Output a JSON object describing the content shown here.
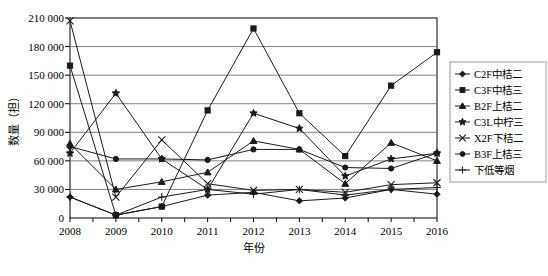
{
  "chart_data": {
    "type": "line",
    "title": "",
    "xlabel": "年份",
    "ylabel": "数量（担）",
    "grid": true,
    "legend_position": "right",
    "categories": [
      "2008",
      "2009",
      "2010",
      "2011",
      "2012",
      "2013",
      "2014",
      "2015",
      "2016"
    ],
    "xlim": [
      "2008",
      "2016"
    ],
    "ylim": [
      0,
      210000
    ],
    "ytick_labels": [
      "0",
      "30 000",
      "60 000",
      "90 000",
      "120 000",
      "150 000",
      "180 000",
      "210 000"
    ],
    "ytick_values": [
      0,
      30000,
      60000,
      90000,
      120000,
      150000,
      180000,
      210000
    ],
    "series": [
      {
        "name": "C2F中桔二",
        "marker": "diamond",
        "values": [
          22000,
          3000,
          12000,
          24000,
          27000,
          18000,
          21000,
          30000,
          25000
        ]
      },
      {
        "name": "C3F中桔三",
        "marker": "square",
        "values": [
          160000,
          3000,
          12000,
          113000,
          199000,
          110000,
          65000,
          139000,
          174000
        ]
      },
      {
        "name": "B2F上桔二",
        "marker": "triangle",
        "values": [
          78000,
          30000,
          38000,
          48000,
          81000,
          72000,
          36000,
          79000,
          60000
        ]
      },
      {
        "name": "C3L中柠三",
        "marker": "star",
        "values": [
          68000,
          131000,
          62000,
          30000,
          110000,
          94000,
          44000,
          62000,
          68000
        ]
      },
      {
        "name": "X2F下桔二",
        "marker": "cross-x",
        "values": [
          207000,
          22000,
          82000,
          36000,
          29000,
          30000,
          27000,
          35000,
          37000
        ]
      },
      {
        "name": "B3F上桔三",
        "marker": "circle",
        "values": [
          75000,
          62000,
          62000,
          61000,
          72000,
          72000,
          53000,
          52000,
          68000
        ]
      },
      {
        "name": "下低等烟",
        "marker": "plus",
        "values": [
          22000,
          3000,
          22000,
          30000,
          25000,
          30000,
          24000,
          30000,
          32000
        ]
      }
    ]
  },
  "legend": {
    "items": [
      {
        "label": "C2F中桔二",
        "marker": "diamond"
      },
      {
        "label": "C3F中桔三",
        "marker": "square"
      },
      {
        "label": "B2F上桔二",
        "marker": "triangle"
      },
      {
        "label": "C3L中柠三",
        "marker": "star"
      },
      {
        "label": "X2F下桔二",
        "marker": "cross-x"
      },
      {
        "label": "B3F上桔三",
        "marker": "circle"
      },
      {
        "label": "下低等烟",
        "marker": "plus"
      }
    ]
  },
  "colors": {
    "series_stroke": "#1a1a1a",
    "gridline": "#808080",
    "plot_border": "#000000",
    "background": "#ffffff"
  }
}
